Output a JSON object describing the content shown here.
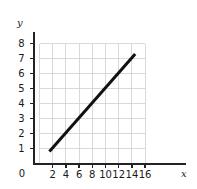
{
  "chart_data": {
    "type": "line",
    "title": "",
    "xlabel": "x",
    "ylabel": "y",
    "xlim": [
      0,
      20
    ],
    "ylim": [
      0,
      8
    ],
    "grid": true,
    "legend": false,
    "x_ticks": [
      0,
      2,
      4,
      6,
      8,
      10,
      12,
      14,
      16
    ],
    "x_tick_labels": [
      "0",
      "2",
      "4",
      "6",
      "8",
      "10",
      "12",
      "14",
      "16"
    ],
    "y_ticks": [
      1,
      2,
      3,
      4,
      5,
      6,
      7,
      8
    ],
    "y_tick_labels": [
      "1",
      "2",
      "3",
      "4",
      "5",
      "6",
      "7",
      "8"
    ],
    "grid_x_range": [
      0,
      16
    ],
    "grid_y_range": [
      0,
      8
    ],
    "series": [
      {
        "name": "line",
        "color": "#111111",
        "x": [
          1.5,
          14.5
        ],
        "y": [
          0.8,
          7.3
        ],
        "slope": 0.5,
        "intercept": 0.05
      }
    ],
    "colors": {
      "line": "#111111",
      "axis": "#222222",
      "grid": "#cfcfd4",
      "background": "#ffffff",
      "text": "#1a1a1a"
    }
  },
  "labels": {
    "y_axis_name": "y",
    "x_axis_name": "x",
    "origin": "0"
  }
}
